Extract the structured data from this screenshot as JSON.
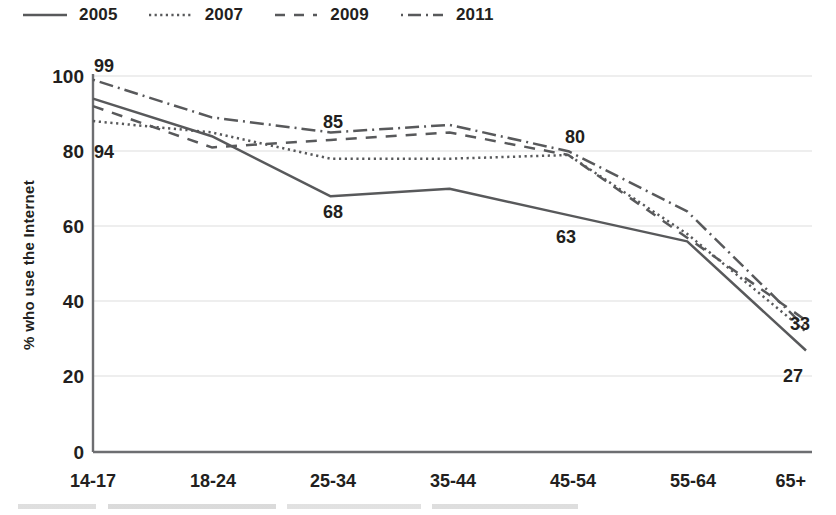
{
  "legend": {
    "position": "top-left",
    "items": [
      {
        "label": "2005",
        "style": "solid",
        "swatch": "solid-line-swatch"
      },
      {
        "label": "2007",
        "style": "dotted",
        "swatch": "dotted-line-swatch"
      },
      {
        "label": "2009",
        "style": "dashed",
        "swatch": "dashed-line-swatch"
      },
      {
        "label": "2011",
        "style": "dashdot",
        "swatch": "dashdot-line-swatch"
      }
    ]
  },
  "axes": {
    "ylabel": "% who use the Internet",
    "yticks": [
      "0",
      "20",
      "40",
      "60",
      "80",
      "100"
    ],
    "xticks": [
      "14-17",
      "18-24",
      "25-34",
      "35-44",
      "45-54",
      "55-64",
      "65+"
    ]
  },
  "annotations": [
    {
      "text": "99",
      "series": "2011",
      "category": "14-17"
    },
    {
      "text": "94",
      "series": "2005",
      "category": "14-17"
    },
    {
      "text": "85",
      "series": "2011",
      "category": "25-34"
    },
    {
      "text": "68",
      "series": "2005",
      "category": "25-34"
    },
    {
      "text": "80",
      "series": "2011",
      "category": "45-54"
    },
    {
      "text": "63",
      "series": "2005",
      "category": "45-54"
    },
    {
      "text": "33",
      "series": "2011",
      "category": "65+"
    },
    {
      "text": "27",
      "series": "2005",
      "category": "65+"
    }
  ],
  "colors": {
    "line": "#58595b",
    "text": "#231f20",
    "grid": "#e8e8e8",
    "axis": "#6d6e71",
    "background": "#ffffff"
  },
  "chart_data": {
    "type": "line",
    "title": "",
    "xlabel": "",
    "ylabel": "% who use the Internet",
    "ylim": [
      0,
      100
    ],
    "yticks": [
      0,
      20,
      40,
      60,
      80,
      100
    ],
    "grid": true,
    "legend_position": "top-left",
    "categories": [
      "14-17",
      "18-24",
      "25-34",
      "35-44",
      "45-54",
      "55-64",
      "65+"
    ],
    "series": [
      {
        "name": "2005",
        "style": "solid",
        "values": [
          94,
          84,
          68,
          70,
          63,
          56,
          27
        ]
      },
      {
        "name": "2007",
        "style": "dotted",
        "values": [
          88,
          85,
          78,
          78,
          79,
          58,
          32
        ]
      },
      {
        "name": "2009",
        "style": "dashed",
        "values": [
          92,
          81,
          83,
          85,
          79,
          57,
          35
        ]
      },
      {
        "name": "2011",
        "style": "dashdot",
        "values": [
          99,
          89,
          85,
          87,
          80,
          64,
          33
        ]
      }
    ],
    "data_labels": [
      {
        "series": "2011",
        "category": "14-17",
        "value": 99
      },
      {
        "series": "2005",
        "category": "14-17",
        "value": 94
      },
      {
        "series": "2011",
        "category": "25-34",
        "value": 85
      },
      {
        "series": "2005",
        "category": "25-34",
        "value": 68
      },
      {
        "series": "2011",
        "category": "45-54",
        "value": 80
      },
      {
        "series": "2005",
        "category": "45-54",
        "value": 63
      },
      {
        "series": "2011",
        "category": "65+",
        "value": 33
      },
      {
        "series": "2005",
        "category": "65+",
        "value": 27
      }
    ]
  }
}
